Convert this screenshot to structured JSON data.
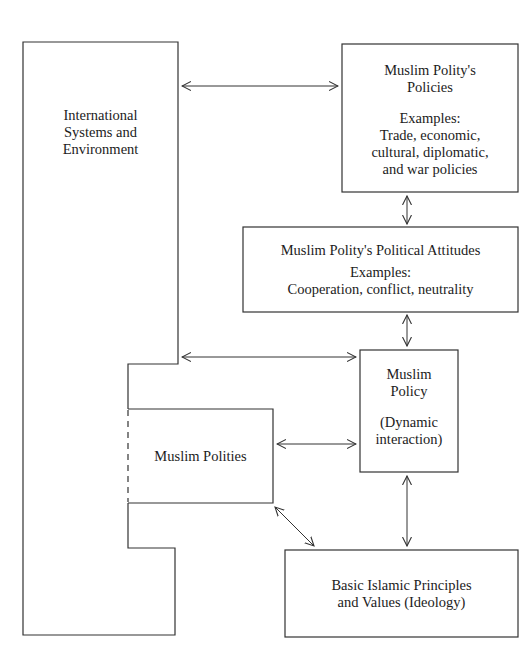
{
  "diagram": {
    "title": "",
    "colors": {
      "line": "#333333",
      "text": "#1c1c1c",
      "background": "#ffffff"
    },
    "nodes": {
      "international": {
        "lines": [
          "International",
          "Systems and",
          "Environment"
        ]
      },
      "policies": {
        "title_lines": [
          "Muslim Polity's",
          "Policies"
        ],
        "examples_label": "Examples:",
        "examples_lines": [
          "Trade, economic,",
          "cultural, diplomatic,",
          "and war policies"
        ]
      },
      "attitudes": {
        "title": "Muslim Polity's Political Attitudes",
        "examples_label": "Examples:",
        "examples": "Cooperation, conflict, neutrality"
      },
      "muslim_policy": {
        "title_lines": [
          "Muslim",
          "Policy"
        ],
        "subtitle_lines": [
          "(Dynamic",
          "interaction)"
        ]
      },
      "muslim_polities": {
        "title": "Muslim Polities"
      },
      "ideology": {
        "lines": [
          "Basic Islamic Principles",
          "and Values (Ideology)"
        ]
      }
    },
    "edges": [
      {
        "from": "international",
        "to": "policies",
        "type": "bidirectional"
      },
      {
        "from": "policies",
        "to": "attitudes",
        "type": "bidirectional"
      },
      {
        "from": "attitudes",
        "to": "muslim_policy",
        "type": "bidirectional"
      },
      {
        "from": "international",
        "to": "muslim_policy",
        "type": "bidirectional"
      },
      {
        "from": "muslim_polities",
        "to": "muslim_policy",
        "type": "bidirectional"
      },
      {
        "from": "muslim_polities",
        "to": "ideology",
        "type": "bidirectional"
      },
      {
        "from": "muslim_policy",
        "to": "ideology",
        "type": "bidirectional"
      }
    ]
  }
}
